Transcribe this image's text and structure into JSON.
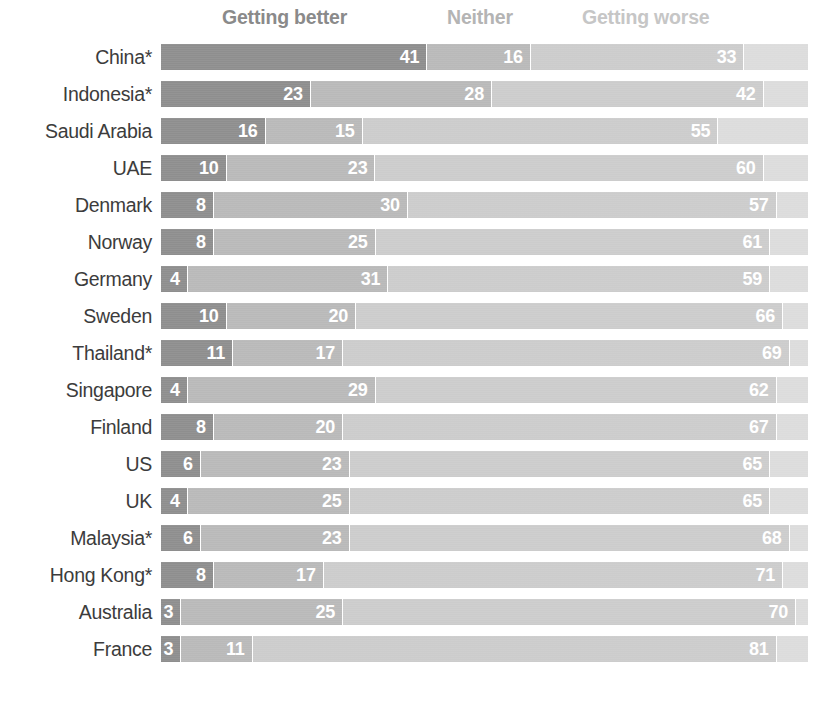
{
  "legend": {
    "better": "Getting better",
    "neither": "Neither",
    "worse": "Getting worse"
  },
  "colors": {
    "better": "#8e8e8e",
    "neither": "#b9b9b9",
    "worse": "#cccccc",
    "remainder": "#dcdcdc",
    "label_text": "#3c3c3c",
    "value_text": "#ffffff"
  },
  "chart_data": {
    "type": "bar",
    "orientation": "horizontal",
    "stacked": true,
    "stack_total": 100,
    "title": "",
    "subtitle": "",
    "xlabel": "",
    "ylabel": "",
    "xlim": [
      0,
      100
    ],
    "grid": false,
    "legend_position": "top",
    "legend_entries": [
      "Getting better",
      "Neither",
      "Getting worse"
    ],
    "categories": [
      "China*",
      "Indonesia*",
      "Saudi Arabia",
      "UAE",
      "Denmark",
      "Norway",
      "Germany",
      "Sweden",
      "Thailand*",
      "Singapore",
      "Finland",
      "US",
      "UK",
      "Malaysia*",
      "Hong Kong*",
      "Australia",
      "France"
    ],
    "series": [
      {
        "name": "Getting better",
        "values": [
          41,
          23,
          16,
          10,
          8,
          8,
          4,
          10,
          11,
          4,
          8,
          6,
          4,
          6,
          8,
          3,
          3
        ]
      },
      {
        "name": "Neither",
        "values": [
          16,
          28,
          15,
          23,
          30,
          25,
          31,
          20,
          17,
          29,
          20,
          23,
          25,
          23,
          17,
          25,
          11
        ]
      },
      {
        "name": "Getting worse",
        "values": [
          33,
          42,
          55,
          60,
          57,
          61,
          59,
          66,
          69,
          62,
          67,
          65,
          65,
          68,
          71,
          70,
          81
        ]
      }
    ],
    "rows": [
      {
        "label": "China*",
        "better": 41,
        "neither": 16,
        "worse": 33,
        "remainder": 10
      },
      {
        "label": "Indonesia*",
        "better": 23,
        "neither": 28,
        "worse": 42,
        "remainder": 7
      },
      {
        "label": "Saudi Arabia",
        "better": 16,
        "neither": 15,
        "worse": 55,
        "remainder": 14
      },
      {
        "label": "UAE",
        "better": 10,
        "neither": 23,
        "worse": 60,
        "remainder": 7
      },
      {
        "label": "Denmark",
        "better": 8,
        "neither": 30,
        "worse": 57,
        "remainder": 5
      },
      {
        "label": "Norway",
        "better": 8,
        "neither": 25,
        "worse": 61,
        "remainder": 6
      },
      {
        "label": "Germany",
        "better": 4,
        "neither": 31,
        "worse": 59,
        "remainder": 6
      },
      {
        "label": "Sweden",
        "better": 10,
        "neither": 20,
        "worse": 66,
        "remainder": 4
      },
      {
        "label": "Thailand*",
        "better": 11,
        "neither": 17,
        "worse": 69,
        "remainder": 3
      },
      {
        "label": "Singapore",
        "better": 4,
        "neither": 29,
        "worse": 62,
        "remainder": 5
      },
      {
        "label": "Finland",
        "better": 8,
        "neither": 20,
        "worse": 67,
        "remainder": 5
      },
      {
        "label": "US",
        "better": 6,
        "neither": 23,
        "worse": 65,
        "remainder": 6
      },
      {
        "label": "UK",
        "better": 4,
        "neither": 25,
        "worse": 65,
        "remainder": 6
      },
      {
        "label": "Malaysia*",
        "better": 6,
        "neither": 23,
        "worse": 68,
        "remainder": 3
      },
      {
        "label": "Hong Kong*",
        "better": 8,
        "neither": 17,
        "worse": 71,
        "remainder": 4
      },
      {
        "label": "Australia",
        "better": 3,
        "neither": 25,
        "worse": 70,
        "remainder": 2
      },
      {
        "label": "France",
        "better": 3,
        "neither": 11,
        "worse": 81,
        "remainder": 5
      }
    ]
  }
}
